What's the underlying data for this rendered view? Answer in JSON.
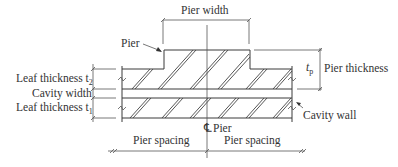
{
  "diagram": {
    "labels": {
      "pier_width": "Pier width",
      "pier_pointer": "Pier",
      "leaf_thickness_t2": "Leaf thickness t",
      "t2_sub": "2",
      "cavity_width": "Cavity width",
      "leaf_thickness_t1": "Leaf thickness t",
      "t1_sub": "1",
      "tp_symbol": "t",
      "tp_sub": "p",
      "pier_thickness": "Pier thickness",
      "cavity_wall": "Cavity wall",
      "centerline_pier": "Pier",
      "pier_spacing_left": "Pier spacing",
      "pier_spacing_right": "Pier spacing",
      "centerline_symbol": "℄"
    },
    "colors": {
      "line": "#3a3a3a",
      "text": "#333333",
      "background": "#ffffff"
    }
  }
}
